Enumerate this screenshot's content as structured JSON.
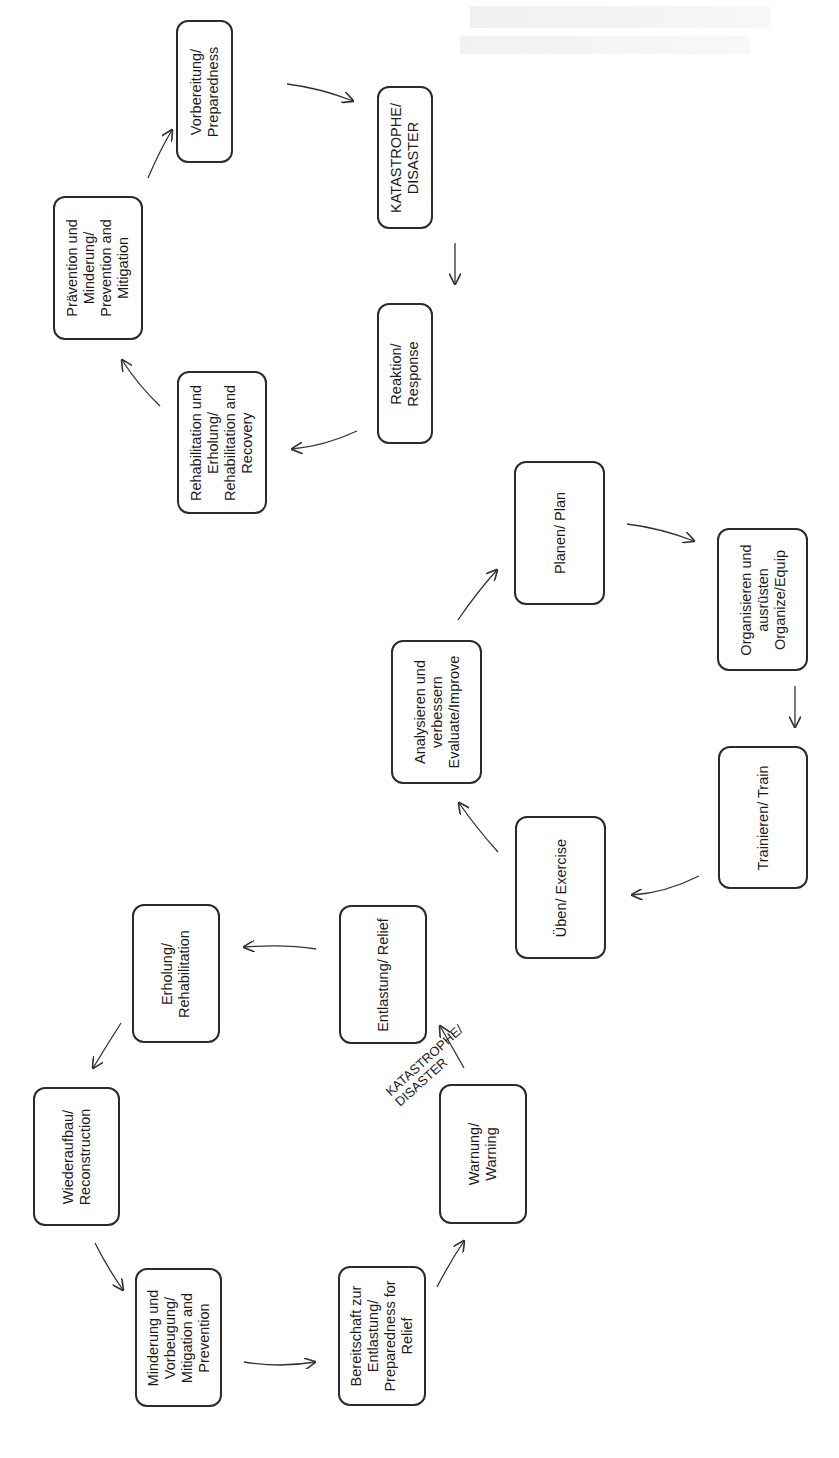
{
  "diagram": {
    "type": "three-cycle disaster-management diagrams (rotated 90° counter-clockwise)",
    "colors": {
      "box_border": "#2b2b2b",
      "arrow": "#333333",
      "text": "#1a1a1a",
      "background": "#ffffff"
    },
    "cycles": [
      {
        "id": "disaster-management-cycle",
        "nodes": [
          {
            "id": "preparedness",
            "label": "Vorbereitung/\nPreparedness"
          },
          {
            "id": "disaster",
            "label": "KATASTROPHE/\nDISASTER"
          },
          {
            "id": "response",
            "label": "Reaktion/\nResponse"
          },
          {
            "id": "rehab-recovery",
            "label": "Rehabilitation und\nErholung/\nRehabilitation and\nRecovery"
          },
          {
            "id": "prevention-mitigation",
            "label": "Prävention und\nMinderung/\nPrevention and\nMitigation"
          }
        ],
        "edges": [
          [
            "preparedness",
            "disaster"
          ],
          [
            "disaster",
            "response"
          ],
          [
            "response",
            "rehab-recovery"
          ],
          [
            "rehab-recovery",
            "prevention-mitigation"
          ],
          [
            "prevention-mitigation",
            "preparedness"
          ]
        ]
      },
      {
        "id": "preparedness-cycle",
        "nodes": [
          {
            "id": "plan",
            "label": "Planen/ Plan"
          },
          {
            "id": "organize",
            "label": "Organisieren und\nausrüsten\nOrganize/Equip"
          },
          {
            "id": "train",
            "label": "Trainieren/ Train"
          },
          {
            "id": "exercise",
            "label": "Üben/ Exercise"
          },
          {
            "id": "evaluate",
            "label": "Analysieren und\nverbessern\nEvaluate/Improve"
          }
        ],
        "edges": [
          [
            "plan",
            "organize"
          ],
          [
            "organize",
            "train"
          ],
          [
            "train",
            "exercise"
          ],
          [
            "exercise",
            "evaluate"
          ],
          [
            "evaluate",
            "plan"
          ]
        ]
      },
      {
        "id": "relief-cycle",
        "nodes": [
          {
            "id": "relief",
            "label": "Entlastung/ Relief"
          },
          {
            "id": "rehabilitation",
            "label": "Erholung/\nRehabilitation"
          },
          {
            "id": "reconstruction",
            "label": "Wiederaufbau/\nReconstruction"
          },
          {
            "id": "mitigation-prevention",
            "label": "Minderung und\nVorbeugung/\nMitigation and\nPrevention"
          },
          {
            "id": "preparedness-relief",
            "label": "Bereitschaft zur\nEntlastung/\nPreparedness for\nRelief"
          },
          {
            "id": "warning",
            "label": "Warnung/\nWarning"
          }
        ],
        "edges": [
          [
            "relief",
            "rehabilitation"
          ],
          [
            "rehabilitation",
            "reconstruction"
          ],
          [
            "reconstruction",
            "mitigation-prevention"
          ],
          [
            "mitigation-prevention",
            "preparedness-relief"
          ],
          [
            "preparedness-relief",
            "warning"
          ],
          [
            "warning",
            "relief"
          ]
        ],
        "edge_labels": [
          {
            "edge": [
              "warning",
              "relief"
            ],
            "label": "KATASTROPHE/\nDISASTER"
          }
        ]
      }
    ]
  }
}
